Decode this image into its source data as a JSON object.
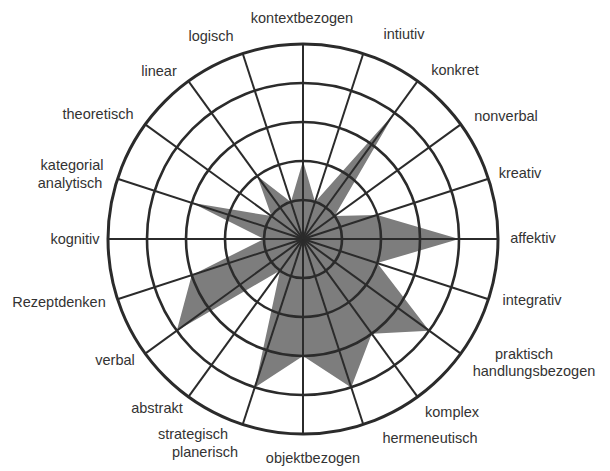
{
  "chart_data": {
    "type": "radar",
    "title": "",
    "scale": {
      "min": 0,
      "max": 5,
      "rings": 5,
      "tick_labels_shown": false
    },
    "categories": [
      "kontextbezogen",
      "intiutiv",
      "konkret",
      "nonverbal",
      "kreativ",
      "affektiv",
      "integrativ",
      "praktisch handlungsbezogen",
      "komplex",
      "hermeneutisch",
      "objektbezogen",
      "strategisch planerisch",
      "abstrakt",
      "verbal",
      "Rezeptdenken",
      "kognitiv",
      "kategorial analytisch",
      "theoretisch",
      "linear",
      "logisch"
    ],
    "series": [
      {
        "name": "profile",
        "values": [
          2,
          1,
          4,
          1,
          2,
          4,
          2,
          4,
          3,
          4,
          3,
          4,
          1,
          4,
          3,
          1,
          3,
          1,
          2,
          1
        ]
      }
    ],
    "grid": true,
    "legend": "none",
    "colors": {
      "fill": "#7d7d7d",
      "grid": "#2b2b2b",
      "text": "#333333"
    }
  },
  "labels": [
    {
      "text": "kontextbezogen",
      "x": 302,
      "y": 10,
      "w": 130
    },
    {
      "text": "intiutiv",
      "x": 404,
      "y": 26,
      "w": 60
    },
    {
      "text": "konkret",
      "x": 455,
      "y": 62,
      "w": 60
    },
    {
      "text": "nonverbal",
      "x": 506,
      "y": 108,
      "w": 80
    },
    {
      "text": "kreativ",
      "x": 520,
      "y": 165,
      "w": 60
    },
    {
      "text": "affektiv",
      "x": 533,
      "y": 230,
      "w": 64
    },
    {
      "text": "integrativ",
      "x": 532,
      "y": 292,
      "w": 72
    },
    {
      "text": "praktisch",
      "x": 524,
      "y": 346,
      "w": 80
    },
    {
      "text": "handlungsbezogen",
      "x": 534,
      "y": 363,
      "w": 140
    },
    {
      "text": "komplex",
      "x": 452,
      "y": 404,
      "w": 70
    },
    {
      "text": "hermeneutisch",
      "x": 430,
      "y": 430,
      "w": 110
    },
    {
      "text": "objektbezogen",
      "x": 313,
      "y": 450,
      "w": 110
    },
    {
      "text": "strategisch",
      "x": 193,
      "y": 426,
      "w": 90
    },
    {
      "text": "planerisch",
      "x": 205,
      "y": 444,
      "w": 90
    },
    {
      "text": "abstrakt",
      "x": 157,
      "y": 400,
      "w": 70
    },
    {
      "text": "verbal",
      "x": 115,
      "y": 352,
      "w": 60
    },
    {
      "text": "Rezeptdenken",
      "x": 59,
      "y": 294,
      "w": 110
    },
    {
      "text": "kognitiv",
      "x": 75,
      "y": 231,
      "w": 70
    },
    {
      "text": "kategorial",
      "x": 72,
      "y": 157,
      "w": 80
    },
    {
      "text": "analytisch",
      "x": 70,
      "y": 175,
      "w": 80
    },
    {
      "text": "theoretisch",
      "x": 98,
      "y": 106,
      "w": 90
    },
    {
      "text": "linear",
      "x": 159,
      "y": 63,
      "w": 60
    },
    {
      "text": "logisch",
      "x": 211,
      "y": 28,
      "w": 60
    }
  ],
  "geometry": {
    "cx": 303,
    "cy": 239,
    "ring_step": 39
  }
}
